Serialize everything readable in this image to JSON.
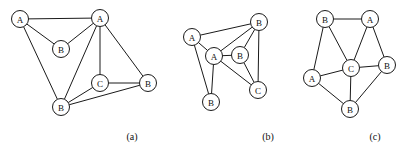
{
  "figure": {
    "background": "#ffffff",
    "stroke_color": "#1a1a1a",
    "text_color": "#111111",
    "width": 418,
    "height": 154,
    "node_radius": 8.5
  },
  "panels": [
    {
      "id": "a",
      "caption": "(a)",
      "caption_x": 132,
      "caption_y": 136,
      "nodes": [
        {
          "id": "a0",
          "label": "A",
          "x": 20,
          "y": 19
        },
        {
          "id": "a1",
          "label": "A",
          "x": 100,
          "y": 18
        },
        {
          "id": "a2",
          "label": "B",
          "x": 61,
          "y": 49
        },
        {
          "id": "a3",
          "label": "C",
          "x": 100,
          "y": 83
        },
        {
          "id": "a4",
          "label": "B",
          "x": 148,
          "y": 83
        },
        {
          "id": "a5",
          "label": "B",
          "x": 61,
          "y": 107
        }
      ],
      "edges": [
        [
          "a0",
          "a1"
        ],
        [
          "a0",
          "a2"
        ],
        [
          "a0",
          "a5"
        ],
        [
          "a1",
          "a2"
        ],
        [
          "a1",
          "a3"
        ],
        [
          "a1",
          "a4"
        ],
        [
          "a1",
          "a5"
        ],
        [
          "a3",
          "a4"
        ],
        [
          "a3",
          "a5"
        ],
        [
          "a4",
          "a5"
        ]
      ]
    },
    {
      "id": "b",
      "caption": "(b)",
      "caption_x": 268,
      "caption_y": 136,
      "nodes": [
        {
          "id": "b0",
          "label": "A",
          "x": 192,
          "y": 37
        },
        {
          "id": "b1",
          "label": "B",
          "x": 259,
          "y": 22
        },
        {
          "id": "b2",
          "label": "A",
          "x": 214,
          "y": 56
        },
        {
          "id": "b3",
          "label": "B",
          "x": 240,
          "y": 55
        },
        {
          "id": "b4",
          "label": "B",
          "x": 211,
          "y": 102
        },
        {
          "id": "b5",
          "label": "C",
          "x": 258,
          "y": 90
        }
      ],
      "edges": [
        [
          "b0",
          "b1"
        ],
        [
          "b0",
          "b2"
        ],
        [
          "b0",
          "b4"
        ],
        [
          "b1",
          "b2"
        ],
        [
          "b1",
          "b3"
        ],
        [
          "b1",
          "b5"
        ],
        [
          "b2",
          "b3"
        ],
        [
          "b2",
          "b4"
        ],
        [
          "b2",
          "b5"
        ],
        [
          "b3",
          "b5"
        ]
      ]
    },
    {
      "id": "c",
      "caption": "(c)",
      "caption_x": 375,
      "caption_y": 136,
      "nodes": [
        {
          "id": "c0",
          "label": "B",
          "x": 325,
          "y": 19
        },
        {
          "id": "c1",
          "label": "A",
          "x": 370,
          "y": 19
        },
        {
          "id": "c2",
          "label": "A",
          "x": 312,
          "y": 78
        },
        {
          "id": "c3",
          "label": "C",
          "x": 351,
          "y": 68
        },
        {
          "id": "c4",
          "label": "B",
          "x": 387,
          "y": 65
        },
        {
          "id": "c5",
          "label": "B",
          "x": 350,
          "y": 109
        }
      ],
      "edges": [
        [
          "c0",
          "c1"
        ],
        [
          "c0",
          "c2"
        ],
        [
          "c0",
          "c3"
        ],
        [
          "c1",
          "c3"
        ],
        [
          "c1",
          "c4"
        ],
        [
          "c2",
          "c3"
        ],
        [
          "c2",
          "c5"
        ],
        [
          "c3",
          "c4"
        ],
        [
          "c3",
          "c5"
        ],
        [
          "c4",
          "c5"
        ]
      ]
    }
  ]
}
